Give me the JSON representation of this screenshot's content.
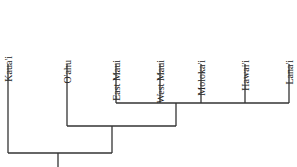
{
  "diagram": {
    "type": "cladogram",
    "orientation": "root-bottom",
    "line_color": "#333333",
    "text_color": "#222222",
    "taxa": [
      {
        "label": "Kaua'i",
        "x": 8
      },
      {
        "label": "O'ahu",
        "x": 67
      },
      {
        "label": "East Maui",
        "x": 116
      },
      {
        "label": "West Maui",
        "x": 160
      },
      {
        "label": "Moloka'i",
        "x": 201
      },
      {
        "label": "Hawai'i",
        "x": 245
      },
      {
        "label": "Lana'i",
        "x": 289
      }
    ],
    "clades": [
      {
        "name": "maui-nui-hawaii",
        "members": [
          "East Maui",
          "West Maui",
          "Moloka'i",
          "Hawai'i",
          "Lana'i"
        ]
      },
      {
        "name": "oahu-plus",
        "members": [
          "O'ahu",
          "maui-nui-hawaii"
        ]
      },
      {
        "name": "root",
        "members": [
          "Kaua'i",
          "oahu-plus"
        ]
      }
    ]
  }
}
